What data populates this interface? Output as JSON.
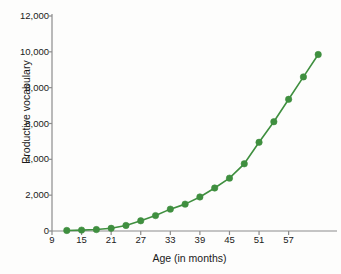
{
  "chart_data": {
    "type": "line",
    "title": "",
    "xlabel": "Age (in months)",
    "ylabel": "Productive vocabulary",
    "xlim": [
      9,
      66
    ],
    "ylim": [
      0,
      12000
    ],
    "xticks": [
      9,
      15,
      21,
      27,
      33,
      39,
      45,
      51,
      57
    ],
    "yticks": [
      0,
      2000,
      4000,
      6000,
      8000,
      10000,
      12000
    ],
    "ytick_labels": [
      "0",
      "2,000",
      "4,000",
      "6,000",
      "8,000",
      "10,000",
      "12,000"
    ],
    "xtick_labels": [
      "9",
      "15",
      "21",
      "27",
      "33",
      "39",
      "45",
      "51",
      "57"
    ],
    "grid": false,
    "legend": null,
    "series": [
      {
        "name": "Productive vocabulary",
        "color": "#3f8f3f",
        "marker": "circle",
        "x": [
          12,
          15,
          18,
          21,
          24,
          27,
          30,
          33,
          36,
          39,
          42,
          45,
          48,
          51,
          54,
          57,
          60,
          63
        ],
        "values": [
          30,
          50,
          80,
          150,
          310,
          570,
          860,
          1220,
          1500,
          1900,
          2400,
          2950,
          3750,
          4950,
          6100,
          7350,
          8600,
          9850
        ]
      }
    ]
  },
  "axis_color": "#8c8c8c",
  "tick_color": "#8c8c8c"
}
